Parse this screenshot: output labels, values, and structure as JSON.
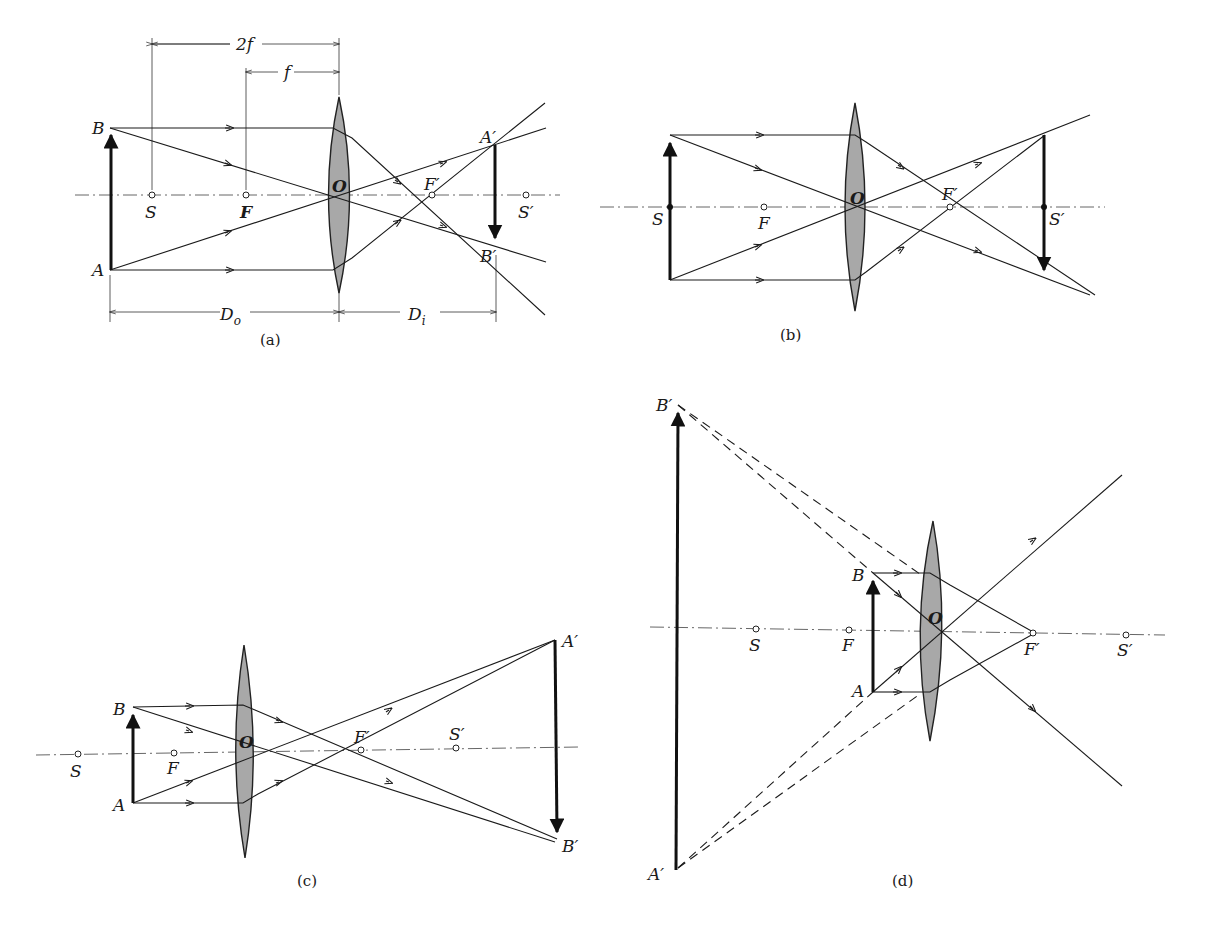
{
  "figure": {
    "panels": [
      {
        "id": "a",
        "caption": "(a)",
        "labels": {
          "B": "B",
          "A": "A",
          "S": "S",
          "F": "F",
          "O": "O",
          "Fp": "F′",
          "Ap": "A′",
          "Bp": "B′",
          "Sp": "S′"
        },
        "dimensions": {
          "two_f": "2f",
          "f": "f",
          "Do": "D",
          "Do_sub": "o",
          "Di": "D",
          "Di_sub": "i"
        }
      },
      {
        "id": "b",
        "caption": "(b)",
        "labels": {
          "S": "S",
          "F": "F",
          "O": "O",
          "Fp": "F′",
          "Sp": "S′"
        }
      },
      {
        "id": "c",
        "caption": "(c)",
        "labels": {
          "B": "B",
          "A": "A",
          "S": "S",
          "F": "F",
          "O": "O",
          "Fp": "F′",
          "Sp": "S′",
          "Ap": "A′",
          "Bp": "B′"
        }
      },
      {
        "id": "d",
        "caption": "(d)",
        "labels": {
          "Bp": "B′",
          "Ap": "A′",
          "B": "B",
          "A": "A",
          "S": "S",
          "F": "F",
          "O": "O",
          "Fp": "F′",
          "Sp": "S′"
        }
      }
    ]
  }
}
